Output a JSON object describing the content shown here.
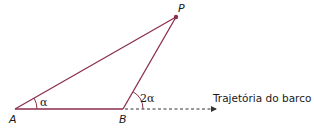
{
  "diagram": {
    "points": {
      "A": {
        "label": "A",
        "x": 15,
        "y": 109
      },
      "B": {
        "label": "B",
        "x": 123,
        "y": 109
      },
      "P": {
        "label": "P",
        "x": 176,
        "y": 17
      }
    },
    "angles": {
      "at_A": "α",
      "at_B": "2α"
    },
    "trajectory_label": "Trajetória do barco",
    "colors": {
      "segment": "#8a2e4e",
      "trajectory": "#333333",
      "text": "#1a1a1a"
    }
  }
}
